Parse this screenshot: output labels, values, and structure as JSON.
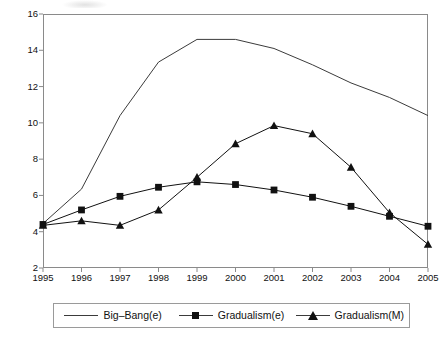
{
  "chart_data": {
    "type": "line",
    "title": "",
    "subtitle": "",
    "xlabel": "",
    "ylabel": "",
    "x": [
      1995,
      1996,
      1997,
      1998,
      1999,
      2000,
      2001,
      2002,
      2003,
      2004,
      2005
    ],
    "categories": [
      "1995",
      "1996",
      "1997",
      "1998",
      "1999",
      "2000",
      "2001",
      "2002",
      "2003",
      "2004",
      "2005"
    ],
    "xlim": [
      1995,
      2005
    ],
    "ylim": [
      2,
      16
    ],
    "yticks": [
      2,
      4,
      6,
      8,
      10,
      12,
      14,
      16
    ],
    "yticklabels": [
      "2",
      "4",
      "6",
      "8",
      "10",
      "12",
      "14",
      "16"
    ],
    "xticklabels": [
      "1995",
      "1996",
      "1997",
      "1998",
      "1999",
      "2000",
      "2001",
      "2002",
      "2003",
      "2004",
      "2005"
    ],
    "grid": false,
    "legend_position": "bottom",
    "series": [
      {
        "name": "Big–Bang(e)",
        "marker": "none",
        "color": "#3b3b3b",
        "values": [
          4.45,
          6.35,
          10.4,
          13.35,
          14.6,
          14.6,
          14.1,
          13.2,
          12.2,
          11.4,
          10.4
        ]
      },
      {
        "name": "Gradualism(e)",
        "marker": "square",
        "color": "#111111",
        "values": [
          4.4,
          5.2,
          5.95,
          6.45,
          6.75,
          6.6,
          6.3,
          5.9,
          5.4,
          4.85,
          4.3
        ]
      },
      {
        "name": "Gradualism(M)",
        "marker": "triangle",
        "color": "#111111",
        "values": [
          4.35,
          4.6,
          4.35,
          5.2,
          7.0,
          8.85,
          9.85,
          9.4,
          7.55,
          5.05,
          3.3
        ]
      }
    ]
  },
  "legend": {
    "items": [
      {
        "label": "Big–Bang(e)",
        "key": "line-key-icon"
      },
      {
        "label": "Gradualism(e)",
        "key": "square-marker-icon"
      },
      {
        "label": "Gradualism(M)",
        "key": "triangle-marker-icon"
      }
    ]
  }
}
